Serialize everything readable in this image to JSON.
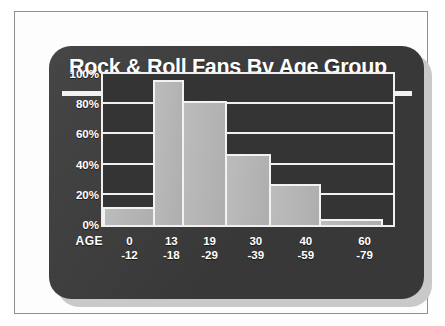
{
  "chart_data": {
    "type": "bar",
    "title": "Rock & Roll Fans By Age Group",
    "xlabel": "AGE",
    "ylabel": "",
    "categories": [
      "0 -12",
      "13 -18",
      "19 -29",
      "30 -39",
      "40 -59",
      "60 -79"
    ],
    "category_lines": [
      {
        "line1": "0",
        "line2": "-12"
      },
      {
        "line1": "13",
        "line2": "-18"
      },
      {
        "line1": "19",
        "line2": "-29"
      },
      {
        "line1": "30",
        "line2": "-39"
      },
      {
        "line1": "40",
        "line2": "-59"
      },
      {
        "line1": "60",
        "line2": "-79"
      }
    ],
    "values": [
      12,
      96,
      82,
      47,
      27,
      4
    ],
    "category_widths": [
      18,
      10.5,
      15.5,
      16,
      18,
      22
    ],
    "ylim": [
      0,
      100
    ],
    "ytick_values": [
      0,
      20,
      40,
      60,
      80,
      100
    ],
    "ytick_labels": [
      "0%",
      "20%",
      "40%",
      "60%",
      "80%",
      "100%"
    ],
    "grid": true,
    "legend": false,
    "colors": {
      "panel_background": "#3c3c3c",
      "plot_background": "#343434",
      "bar_fill": "#b4b4b4",
      "bar_outline": "#f2f2f2",
      "text": "#ffffff",
      "page_background": "#fdfdfd",
      "page_border": "#8f8f8f",
      "panel_shadow": "#c9c9c9"
    }
  }
}
